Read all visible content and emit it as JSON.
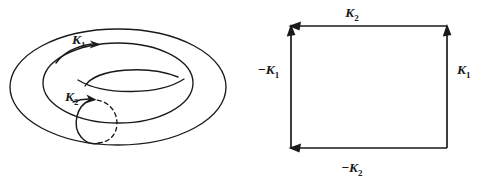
{
  "figure": {
    "background_color": "#ffffff",
    "ink_color": "#1a1a1a",
    "width": 492,
    "height": 183
  },
  "torus_panel": {
    "name": "torus diagram",
    "description": "Ring torus drawn in perspective with two oriented curves",
    "curves": [
      {
        "id": "K1",
        "role": "longitude cycle running around the torus tube",
        "label": "K",
        "subscript": "1",
        "sign": "+",
        "orientation": "clockwise, arrow pointing right along the top of the ring",
        "style": "solid"
      },
      {
        "id": "K2",
        "role": "meridian cycle encircling the tube cross-section",
        "label": "K",
        "subscript": "2",
        "sign": "+",
        "orientation": "arrow pointing up-right at the top of the small circle",
        "style": "solid front half, dashed back half"
      }
    ],
    "labels": {
      "k1": {
        "base": "K",
        "sub": "1",
        "minus": ""
      },
      "k2": {
        "base": "K",
        "sub": "2",
        "minus": ""
      }
    }
  },
  "square_panel": {
    "name": "fundamental domain square",
    "description": "Square with identified oriented edges representing the torus as a quotient of the plane",
    "edges": [
      {
        "id": "top",
        "label_base": "K",
        "label_sub": "2",
        "label_minus": "",
        "label_text": "K2",
        "direction": "arrow points left (toward top-left corner)",
        "position": "top edge, label above center"
      },
      {
        "id": "right",
        "label_base": "K",
        "label_sub": "1",
        "label_minus": "",
        "label_text": "K1",
        "direction": "arrow points up (toward top-right corner)",
        "position": "right edge, label to the right of center"
      },
      {
        "id": "bottom",
        "label_base": "K",
        "label_sub": "2",
        "label_minus": "−",
        "label_text": "-K2",
        "direction": "arrow points left (toward bottom-left corner)",
        "position": "bottom edge, label below center"
      },
      {
        "id": "left",
        "label_base": "K",
        "label_sub": "1",
        "label_minus": "−",
        "label_text": "-K1",
        "direction": "arrow points up (toward top-left corner)",
        "position": "left edge, label to the left of center"
      }
    ],
    "labels": {
      "top": {
        "minus": "",
        "base": "K",
        "sub": "2"
      },
      "right": {
        "minus": "",
        "base": "K",
        "sub": "1"
      },
      "bottom": {
        "minus": "−",
        "base": "K",
        "sub": "2"
      },
      "left": {
        "minus": "−",
        "base": "K",
        "sub": "1"
      }
    }
  }
}
